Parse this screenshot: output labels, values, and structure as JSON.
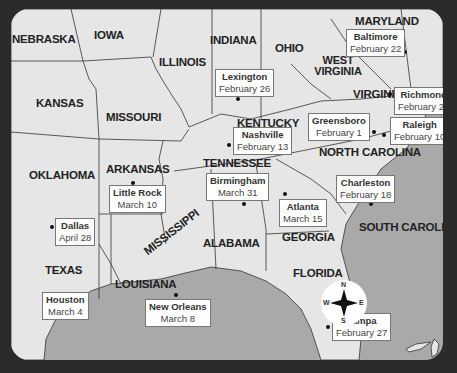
{
  "map": {
    "states": [
      {
        "id": "nebraska",
        "label": "NEBRASKA",
        "x": 1,
        "y": 24
      },
      {
        "id": "iowa",
        "label": "IOWA",
        "x": 83,
        "y": 20
      },
      {
        "id": "illinois",
        "label": "ILLINOIS",
        "x": 148,
        "y": 45
      },
      {
        "id": "indiana",
        "label": "INDIANA",
        "x": 199,
        "y": 23
      },
      {
        "id": "ohio",
        "label": "OHIO",
        "x": 264,
        "y": 30
      },
      {
        "id": "maryland",
        "label": "MARYLAND",
        "x": 345,
        "y": 5
      },
      {
        "id": "west-virginia",
        "label": "WEST VIRGINIA",
        "x": 300,
        "y": 54
      },
      {
        "id": "virginia",
        "label": "VIRGINIA",
        "x": 342,
        "y": 75
      },
      {
        "id": "kansas",
        "label": "KANSAS",
        "x": 25,
        "y": 85
      },
      {
        "id": "missouri",
        "label": "MISSOURI",
        "x": 95,
        "y": 98
      },
      {
        "id": "kentucky",
        "label": "KENTUCKY",
        "x": 226,
        "y": 106
      },
      {
        "id": "oklahoma",
        "label": "OKLAHOMA",
        "x": 18,
        "y": 156
      },
      {
        "id": "arkansas",
        "label": "ARKANSAS",
        "x": 95,
        "y": 152
      },
      {
        "id": "tennessee",
        "label": "TENNESSEE",
        "x": 192,
        "y": 145
      },
      {
        "id": "north-carolina",
        "label": "NORTH CAROLINA",
        "x": 308,
        "y": 132
      },
      {
        "id": "texas",
        "label": "TEXAS",
        "x": 34,
        "y": 253
      },
      {
        "id": "louisiana",
        "label": "LOUISIANA",
        "x": 104,
        "y": 266
      },
      {
        "id": "mississippi",
        "label": "MISSISSIPPI",
        "x": 146,
        "y": 215
      },
      {
        "id": "alabama",
        "label": "ALABAMA",
        "x": 192,
        "y": 225
      },
      {
        "id": "georgia",
        "label": "GEORGIA",
        "x": 271,
        "y": 218
      },
      {
        "id": "south-carolina",
        "label": "SOUTH CAROLINA",
        "x": 349,
        "y": 208
      },
      {
        "id": "florida",
        "label": "FLORIDA",
        "x": 282,
        "y": 255
      }
    ],
    "cities": [
      {
        "name": "Baltimore",
        "date": "February 22",
        "box_x": 336,
        "box_y": 24,
        "dot_x": 391,
        "dot_y": 40
      },
      {
        "name": "Lexington",
        "date": "February 26",
        "box_x": 205,
        "box_y": 60,
        "dot_x": 227,
        "dot_y": 88
      },
      {
        "name": "Richmond",
        "date": "February 20",
        "box_x": 382,
        "box_y": 78,
        "dot_x": 377,
        "dot_y": 83
      },
      {
        "name": "Greensboro",
        "date": "February 1",
        "box_x": 308,
        "box_y": 105,
        "dot_x": 361,
        "dot_y": 122
      },
      {
        "name": "Raleigh",
        "date": "February 10",
        "box_x": 380,
        "box_y": 108,
        "dot_x": 373,
        "dot_y": 125
      },
      {
        "name": "Nashville",
        "date": "February 13",
        "box_x": 222,
        "box_y": 118,
        "dot_x": 215,
        "dot_y": 134
      },
      {
        "name": "Little Rock",
        "date": "March 10",
        "box_x": 100,
        "box_y": 176,
        "dot_x": 120,
        "dot_y": 171
      },
      {
        "name": "Birmingham",
        "date": "March 31",
        "box_x": 204,
        "box_y": 167,
        "dot_x": 231,
        "dot_y": 188
      },
      {
        "name": "Atlanta",
        "date": "March 15",
        "box_x": 270,
        "box_y": 190,
        "dot_x": 276,
        "dot_y": 178
      },
      {
        "name": "Charleston",
        "date": "February 18",
        "box_x": 325,
        "box_y": 168,
        "dot_x": 359,
        "dot_y": 205
      },
      {
        "name": "Dallas",
        "date": "April 28",
        "box_x": 55,
        "box_y": 211,
        "dot_x": 40,
        "dot_y": 216
      },
      {
        "name": "Houston",
        "date": "March 4",
        "box_x": 31,
        "box_y": 270,
        "dot_x": 70,
        "dot_y": 287
      },
      {
        "name": "New Orleans",
        "date": "March 8",
        "box_x": 134,
        "box_y": 290,
        "dot_x": 164,
        "dot_y": 284
      },
      {
        "name": "Tampa",
        "date": "February 27",
        "box_x": 320,
        "box_y": 301,
        "dot_x": 313,
        "dot_y": 308
      }
    ],
    "compass": {
      "n": "N",
      "e": "E",
      "s": "S",
      "w": "W"
    },
    "colors": {
      "land": "#e6e6e6",
      "water": "#a9a9a9",
      "frame": "#2b2b2b",
      "border": "#333333"
    }
  }
}
